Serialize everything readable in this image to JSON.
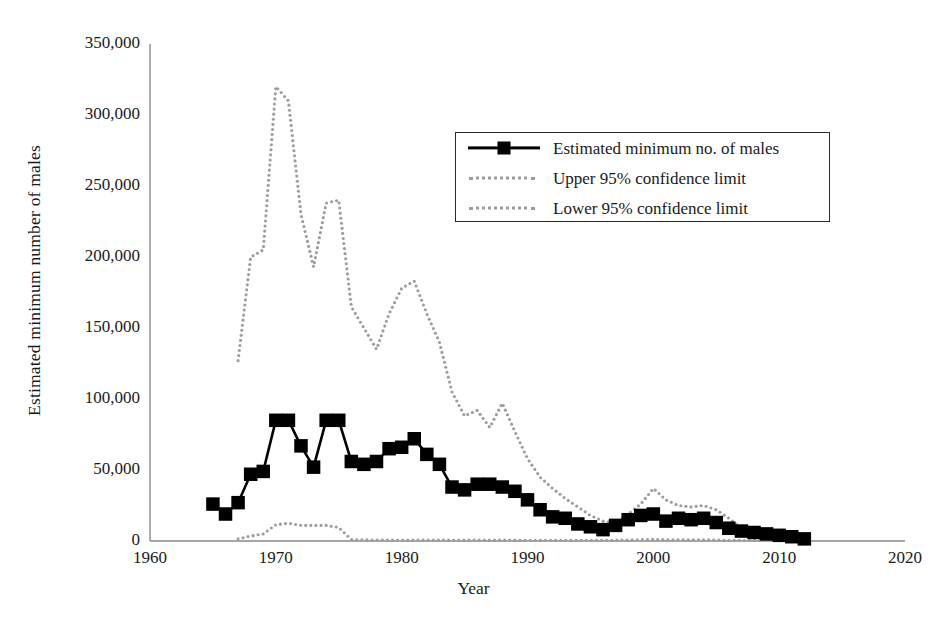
{
  "chart_data": {
    "type": "line",
    "title": "",
    "xlabel": "Year",
    "ylabel": "Estimated minimum number of males",
    "xlim": [
      1960,
      2020
    ],
    "ylim": [
      0,
      350000
    ],
    "xticks": [
      1960,
      1970,
      1980,
      1990,
      2000,
      2010,
      2020
    ],
    "xtick_labels": [
      "1960",
      "1970",
      "1980",
      "1990",
      "2000",
      "2010",
      "2020"
    ],
    "yticks": [
      0,
      50000,
      100000,
      150000,
      200000,
      250000,
      300000,
      350000
    ],
    "ytick_labels": [
      "0",
      "50,000",
      "100,000",
      "150,000",
      "200,000",
      "250,000",
      "300,000",
      "350,000"
    ],
    "grid": false,
    "legend_position": "upper right",
    "series": [
      {
        "name": "Estimated minimum no. of males",
        "style": "solid-with-square-markers",
        "color": "#000000",
        "x": [
          1965,
          1966,
          1967,
          1968,
          1969,
          1970,
          1971,
          1972,
          1973,
          1974,
          1975,
          1976,
          1977,
          1978,
          1979,
          1980,
          1981,
          1982,
          1983,
          1984,
          1985,
          1986,
          1987,
          1988,
          1989,
          1990,
          1991,
          1992,
          1993,
          1994,
          1995,
          1996,
          1997,
          1998,
          1999,
          2000,
          2001,
          2002,
          2003,
          2004,
          2005,
          2006,
          2007,
          2008,
          2009,
          2010,
          2011,
          2012
        ],
        "values": [
          26000,
          19000,
          27000,
          47000,
          49000,
          85000,
          85000,
          67000,
          52000,
          85000,
          85000,
          56000,
          54000,
          56000,
          65000,
          66000,
          72000,
          61000,
          54000,
          38000,
          36000,
          40000,
          40000,
          38000,
          35000,
          29000,
          22000,
          17000,
          16000,
          12000,
          10000,
          8000,
          11000,
          15000,
          18000,
          19000,
          14000,
          16000,
          15000,
          16000,
          13000,
          9000,
          7000,
          6000,
          5000,
          4000,
          3000,
          1500
        ]
      },
      {
        "name": "Upper 95% confidence limit",
        "style": "dotted",
        "color": "#9d9d9d",
        "x": [
          1967,
          1968,
          1969,
          1970,
          1971,
          1972,
          1973,
          1974,
          1975,
          1976,
          1977,
          1978,
          1979,
          1980,
          1981,
          1982,
          1983,
          1984,
          1985,
          1986,
          1987,
          1988,
          1989,
          1990,
          1991,
          1992,
          1993,
          1994,
          1995,
          1996,
          1997,
          1998,
          1999,
          2000,
          2001,
          2002,
          2003,
          2004,
          2005,
          2006,
          2007,
          2008,
          2009,
          2010,
          2011,
          2012
        ],
        "values": [
          127000,
          200000,
          205000,
          320000,
          310000,
          230000,
          193000,
          238000,
          240000,
          165000,
          150000,
          135000,
          160000,
          178000,
          183000,
          160000,
          140000,
          105000,
          88000,
          92000,
          80000,
          97000,
          77000,
          58000,
          45000,
          37000,
          30000,
          24000,
          18000,
          14000,
          13000,
          19000,
          26000,
          37000,
          29000,
          25000,
          24000,
          25000,
          22000,
          16000,
          9000,
          6000,
          5000,
          4000,
          3000,
          2000
        ]
      },
      {
        "name": "Lower 95% confidence limit",
        "style": "dotted",
        "color": "#9d9d9d",
        "x": [
          1967,
          1968,
          1969,
          1970,
          1971,
          1972,
          1973,
          1974,
          1975,
          1976,
          1977,
          1978,
          1979,
          1980,
          1981,
          1982,
          1983,
          1984,
          1985,
          1986,
          1987,
          1988,
          1989,
          1990,
          1991,
          1992,
          1993,
          1994,
          1995,
          1996,
          1997,
          1998,
          1999,
          2000,
          2001,
          2002,
          2003,
          2004,
          2005,
          2006,
          2007,
          2008,
          2009,
          2010,
          2011,
          2012
        ],
        "values": [
          1500,
          3500,
          5000,
          11500,
          12500,
          11000,
          11000,
          11000,
          9500,
          1000,
          800,
          700,
          700,
          700,
          700,
          600,
          600,
          600,
          600,
          600,
          600,
          600,
          600,
          500,
          500,
          500,
          500,
          500,
          500,
          500,
          600,
          700,
          900,
          1200,
          900,
          800,
          800,
          800,
          700,
          500,
          400,
          300,
          300,
          200,
          200,
          100
        ]
      }
    ]
  }
}
